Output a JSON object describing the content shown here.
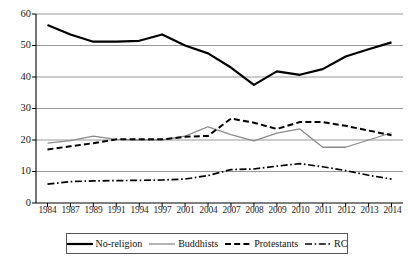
{
  "chart_data": {
    "type": "line",
    "title": "",
    "xlabel": "",
    "ylabel": "",
    "ylim": [
      0,
      60
    ],
    "ytick_step": 10,
    "grid": true,
    "legend_position": "bottom",
    "categories": [
      "1984",
      "1987",
      "1989",
      "1991",
      "1994",
      "1997",
      "2001",
      "2004",
      "2007",
      "2008",
      "2009",
      "2010",
      "2011",
      "2012",
      "2013",
      "2014"
    ],
    "yticks": [
      "0",
      "10",
      "20",
      "30",
      "40",
      "50",
      "60"
    ],
    "series": [
      {
        "name": "No-religion",
        "style": "solid",
        "color": "#000000",
        "width": 2.2,
        "values": [
          56.5,
          53.5,
          51.2,
          51.2,
          51.5,
          53.5,
          50.0,
          47.5,
          43.0,
          37.5,
          41.8,
          40.7,
          42.5,
          46.5,
          48.8,
          51.0
        ]
      },
      {
        "name": "Buddhists",
        "style": "solid",
        "color": "#8a8a8a",
        "width": 1.3,
        "values": [
          19.0,
          19.8,
          21.2,
          20.2,
          20.0,
          20.0,
          21.2,
          24.2,
          21.7,
          19.7,
          22.2,
          23.5,
          17.7,
          17.7,
          20.0,
          22.3
        ]
      },
      {
        "name": "Protestants",
        "style": "dashed",
        "color": "#000000",
        "width": 2.0,
        "values": [
          17.0,
          18.0,
          19.0,
          20.2,
          20.2,
          20.2,
          21.0,
          21.3,
          26.8,
          25.5,
          23.5,
          25.7,
          25.7,
          24.5,
          23.0,
          21.5
        ]
      },
      {
        "name": "RC",
        "style": "dashdot",
        "color": "#000000",
        "width": 1.7,
        "values": [
          6.0,
          6.8,
          7.0,
          7.1,
          7.2,
          7.3,
          7.6,
          8.7,
          10.6,
          10.8,
          11.7,
          12.5,
          11.5,
          10.3,
          8.8,
          7.6
        ]
      }
    ]
  },
  "legend": {
    "items": [
      {
        "label": "No-religion"
      },
      {
        "label": "Buddhists"
      },
      {
        "label": "Protestants"
      },
      {
        "label": "RC"
      }
    ]
  }
}
